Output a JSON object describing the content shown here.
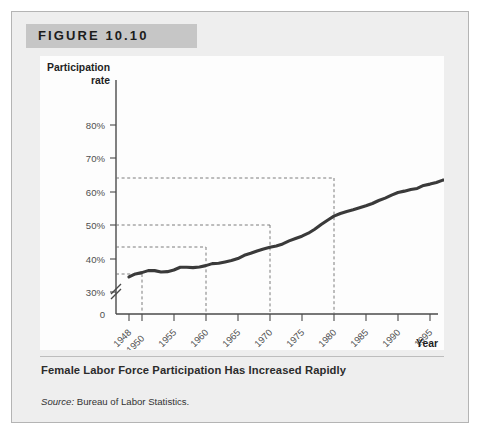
{
  "figure": {
    "header_label": "FIGURE 10.10",
    "caption_title": "Female Labor Force Participation Has Increased Rapidly",
    "source_prefix": "Source:",
    "source_text": "Bureau of Labor Statistics."
  },
  "colors": {
    "panel_background": "#eeeeee",
    "panel_border": "#b4b4b4",
    "header_band": "#c6c6c6",
    "plot_background": "#fdfdfd",
    "series_line": "#3a3a3a",
    "axis": "#4a4a4a",
    "guide_line": "#6d6d6d"
  },
  "chart_data": {
    "type": "line",
    "title": "Female Labor Force Participation Has Increased Rapidly",
    "xlabel": "Year",
    "ylabel": "Participation rate",
    "ylabel_line1": "Participation",
    "ylabel_line2": "rate",
    "xlim": [
      1948,
      2006
    ],
    "ylim": [
      28,
      82
    ],
    "y_axis_break": true,
    "y_break_note": "axis broken between 0 and 30%",
    "grid": false,
    "legend": null,
    "ytick_labels": [
      "0",
      "30%",
      "40%",
      "50%",
      "60%",
      "70%",
      "80%"
    ],
    "ytick_values": [
      0,
      30,
      40,
      50,
      60,
      70,
      80
    ],
    "xtick_labels": [
      "1948",
      "1950",
      "1955",
      "1960",
      "1965",
      "1970",
      "1975",
      "1980",
      "1985",
      "1990",
      "1995",
      "2000",
      "2005"
    ],
    "xtick_values": [
      1948,
      1950,
      1955,
      1960,
      1965,
      1970,
      1975,
      1980,
      1985,
      1990,
      1995,
      2000,
      2005
    ],
    "series": [
      {
        "name": "Female labor force participation rate",
        "x": [
          1948,
          1949,
          1950,
          1951,
          1952,
          1953,
          1954,
          1955,
          1956,
          1957,
          1958,
          1959,
          1960,
          1961,
          1962,
          1963,
          1964,
          1965,
          1966,
          1967,
          1968,
          1969,
          1970,
          1971,
          1972,
          1973,
          1974,
          1975,
          1976,
          1977,
          1978,
          1979,
          1980,
          1981,
          1982,
          1983,
          1984,
          1985,
          1986,
          1987,
          1988,
          1989,
          1990,
          1991,
          1992,
          1993,
          1994,
          1995,
          1996,
          1997,
          1998,
          1999,
          2000,
          2001,
          2002,
          2003,
          2004,
          2005,
          2006
        ],
        "y": [
          34.5,
          35.4,
          35.8,
          36.4,
          36.4,
          36.0,
          36.1,
          36.6,
          37.4,
          37.4,
          37.3,
          37.5,
          37.9,
          38.5,
          38.6,
          39.0,
          39.4,
          40.0,
          41.0,
          41.6,
          42.3,
          42.9,
          43.4,
          43.8,
          44.4,
          45.3,
          46.0,
          46.7,
          47.6,
          48.8,
          50.2,
          51.5,
          52.7,
          53.5,
          54.1,
          54.6,
          55.2,
          55.8,
          56.5,
          57.4,
          58.1,
          59.0,
          59.8,
          60.2,
          60.7,
          61.0,
          61.9,
          62.3,
          62.8,
          63.5,
          63.7,
          64.0,
          64.1,
          63.8,
          63.5,
          63.3,
          63.1,
          62.9,
          63.0
        ]
      }
    ],
    "annotations": [
      {
        "type": "reference",
        "year": 1950,
        "rate": 35.0,
        "style": "dashed-crosshair"
      },
      {
        "type": "reference",
        "year": 1960,
        "rate": 43.0,
        "style": "dashed-crosshair"
      },
      {
        "type": "reference",
        "year": 1970,
        "rate": 50.0,
        "style": "dashed-crosshair"
      },
      {
        "type": "reference",
        "year": 1980,
        "rate": 64.0,
        "style": "dashed-crosshair"
      }
    ]
  }
}
